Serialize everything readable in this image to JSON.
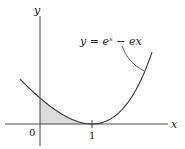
{
  "labels": {
    "y_axis": "y",
    "x_axis": "x",
    "equation": "y = eˣ − ex",
    "origin": "0",
    "tick_one": "1"
  },
  "colors": {
    "curve": "#333333",
    "shade": "#d9d9d9",
    "axis": "#333333"
  }
}
